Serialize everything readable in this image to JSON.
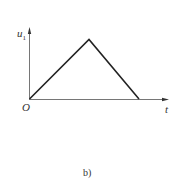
{
  "figure": {
    "caption": "b)",
    "y_axis_label": "u",
    "y_axis_subscript": "1",
    "x_axis_label": "t",
    "origin_label": "O"
  },
  "colors": {
    "axis": "#555555",
    "curve": "#222222",
    "text": "#333333"
  },
  "waveform": {
    "shape": "triangle",
    "points": [
      {
        "x": 0,
        "y": 0
      },
      {
        "x": 0.55,
        "y": 1
      },
      {
        "x": 1,
        "y": 0
      }
    ]
  }
}
